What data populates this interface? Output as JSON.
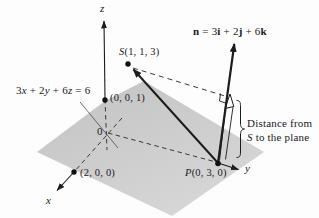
{
  "figure": {
    "axes": {
      "x_label": "x",
      "y_label": "y",
      "z_label": "z",
      "origin_label": "0"
    },
    "points": {
      "S": {
        "name": "S",
        "coords": "(1, 1, 3)"
      },
      "P": {
        "name": "P",
        "coords": "(0, 3, 0)"
      },
      "z_intercept": "(0, 0, 1)",
      "x_intercept": "(2, 0, 0)"
    },
    "plane_equation": {
      "c1": "3",
      "v1": "x",
      "c2": " + 2",
      "v2": "y",
      "c3": " + 6",
      "v3": "z",
      "c4": " = 6"
    },
    "normal_vector_label": {
      "n": "n",
      "eq": " = 3",
      "i": "i",
      "p1": " + 2",
      "j": "j",
      "p2": " + 6",
      "k": "k"
    },
    "distance_label": {
      "line1": "Distance from",
      "line2_s": "S",
      "line2_rest": " to the plane"
    },
    "colors": {
      "line": "#1c1c1c",
      "dashed_line": "#3a3a3a",
      "plane_fill_top": "#c2c2c2",
      "plane_fill_bottom": "#d7d7d7",
      "background": "#fdfdfd",
      "text": "#1a1a1a"
    }
  }
}
